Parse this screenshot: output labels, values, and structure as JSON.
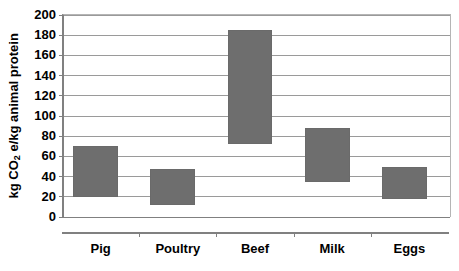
{
  "chart_data": {
    "type": "bar",
    "bar_style": "floating-range",
    "title": "",
    "subtitle": "",
    "xlabel": "",
    "ylabel": "kg CO2 e/kg animal protein",
    "ylabel_parts": {
      "prefix": "kg CO",
      "subscript": "2",
      "suffix": " e/kg animal protein"
    },
    "categories": [
      "Pig",
      "Poultry",
      "Beef",
      "Milk",
      "Eggs"
    ],
    "series": [
      {
        "name": "range",
        "low": [
          20,
          12,
          72,
          35,
          18
        ],
        "high": [
          70,
          48,
          185,
          88,
          50
        ]
      }
    ],
    "ylim": [
      0,
      200
    ],
    "ytick_step": 20,
    "yticks": [
      0,
      20,
      40,
      60,
      80,
      100,
      120,
      140,
      160,
      180,
      200
    ],
    "ytick_labels": [
      "0",
      "20",
      "40",
      "60",
      "80",
      "100",
      "120",
      "140",
      "160",
      "180",
      "200"
    ],
    "grid": true,
    "grid_axis": "y",
    "legend": false,
    "legend_position": "none",
    "colors": {
      "bar_fill": "#6e6e6e",
      "bar_border": "#6a6a6a",
      "gridline": "#9a9a9a",
      "axis": "#808080",
      "plot_border": "#b5b5b5",
      "text": "#000000",
      "background": "#ffffff"
    }
  }
}
